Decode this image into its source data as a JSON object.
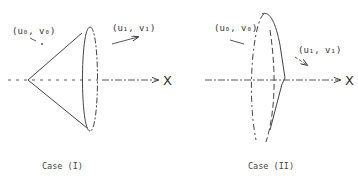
{
  "figure": {
    "case1": {
      "caption": "Case (I)",
      "label_left": "(u₀, v₀)",
      "label_right": "(u₁, v₁)",
      "axis_label": "X"
    },
    "case2": {
      "caption": "Case (II)",
      "label_left": "(u₀, v₀)",
      "label_right": "(u₁, v₁)",
      "axis_label": "X"
    },
    "colors": {
      "ink": "#333333",
      "background": "#ffffff"
    }
  }
}
